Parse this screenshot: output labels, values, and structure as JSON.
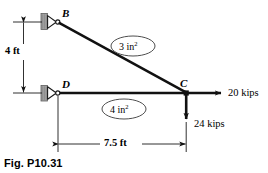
{
  "figure": {
    "caption": "Fig. P10.31",
    "background_color": "#ffffff",
    "line_color": "#000000",
    "support_block_color": "#a8a8a8"
  },
  "joints": [
    {
      "id": "B",
      "label": "B",
      "x": 58,
      "y": 22,
      "support": "pin",
      "label_x": 62,
      "label_y": 10
    },
    {
      "id": "D",
      "label": "D",
      "x": 58,
      "y": 93,
      "support": "pin",
      "label_x": 62,
      "label_y": 81
    },
    {
      "id": "C",
      "label": "C",
      "x": 186,
      "y": 93,
      "support": "none",
      "label_x": 180,
      "label_y": 80
    }
  ],
  "members": [
    {
      "id": "BC",
      "from": "B",
      "to": "C",
      "area_label": "3 in",
      "area_exponent": "2",
      "ellipse_cx": 133,
      "ellipse_cy": 46
    },
    {
      "id": "DC",
      "from": "D",
      "to": "C",
      "area_label": "4 in",
      "area_exponent": "2",
      "ellipse_cx": 124,
      "ellipse_cy": 109
    }
  ],
  "loads": [
    {
      "id": "horizontal-load",
      "label": "20 kips",
      "magnitude": 20,
      "unit": "kips",
      "direction": "right",
      "applied_at": "C",
      "label_x": 228,
      "label_y": 88
    },
    {
      "id": "vertical-load",
      "label": "24 kips",
      "magnitude": 24,
      "unit": "kips",
      "direction": "down",
      "applied_at": "C",
      "label_x": 194,
      "label_y": 119
    }
  ],
  "dimensions": [
    {
      "id": "vertical-dimension",
      "label": "4 ft",
      "value": 4,
      "unit": "ft",
      "orientation": "vertical",
      "label_x": 6,
      "label_y": 51
    },
    {
      "id": "horizontal-dimension",
      "label": "7.5 ft",
      "value": 7.5,
      "unit": "ft",
      "orientation": "horizontal",
      "label_x": 105,
      "label_y": 138
    }
  ]
}
